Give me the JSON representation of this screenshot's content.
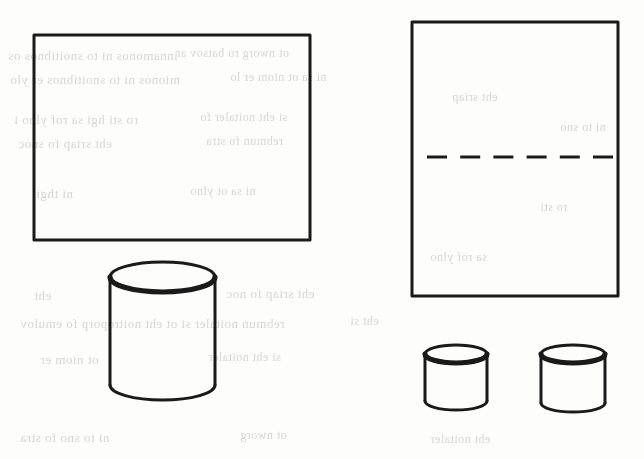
{
  "page": {
    "width": 644,
    "height": 459,
    "background_color": "#fdfdfc",
    "ink_color": "#1a1a1a",
    "bleed_text_color": "#cfcfcf"
  },
  "figure": {
    "caption": "",
    "shapes": [
      {
        "id": "left-rectangle",
        "name": "left-rectangle",
        "type": "rectangle",
        "x": 34,
        "y": 35,
        "width": 276,
        "height": 205,
        "stroke_width": 3,
        "fill": "none"
      },
      {
        "id": "large-cylinder",
        "name": "large-cylinder",
        "type": "cylinder",
        "x": 110,
        "y": 262,
        "width": 105,
        "height": 138,
        "ellipse_ry": 15,
        "stroke_width": 3,
        "fill": "none"
      },
      {
        "id": "right-rectangle",
        "name": "right-rectangle",
        "type": "rectangle",
        "x": 412,
        "y": 22,
        "width": 206,
        "height": 274,
        "stroke_width": 3,
        "fill": "none"
      },
      {
        "id": "divider-dashed-line",
        "name": "divider-dashed-line",
        "type": "dashed-line",
        "x1": 427,
        "y1": 157,
        "x2": 613,
        "y2": 157,
        "stroke_width": 3,
        "dash_count": 6,
        "dash_length": 20,
        "gap_length": 13
      },
      {
        "id": "small-cylinder-left",
        "name": "small-cylinder-left",
        "type": "cylinder",
        "x": 425,
        "y": 345,
        "width": 62,
        "height": 65,
        "ellipse_ry": 9,
        "stroke_width": 3,
        "fill": "none"
      },
      {
        "id": "small-cylinder-right",
        "name": "small-cylinder-right",
        "type": "cylinder",
        "x": 541,
        "y": 345,
        "width": 64,
        "height": 67,
        "ellipse_ry": 9,
        "stroke_width": 3,
        "fill": "none"
      }
    ]
  },
  "bleed_through": {
    "note": "Illegible mirrored show-through text from the opposite side of the scanned page.",
    "lines": [
      {
        "text": "innamonos ni to snoitibnos os",
        "x": 8,
        "y": 48,
        "size": 13
      },
      {
        "text": "ot nworg ro batsov ar",
        "x": 176,
        "y": 46,
        "size": 12
      },
      {
        "text": "mionos ni to snoitibnos er ylo",
        "x": 10,
        "y": 72,
        "size": 13
      },
      {
        "text": "ni sa ot niom er lo",
        "x": 230,
        "y": 70,
        "size": 12
      },
      {
        "text": "ro sti hgi sa rof ylno i",
        "x": 14,
        "y": 112,
        "size": 13
      },
      {
        "text": "si eht noitaler fo ",
        "x": 200,
        "y": 110,
        "size": 12
      },
      {
        "text": "eht sriap fo snoc",
        "x": 18,
        "y": 136,
        "size": 13
      },
      {
        "text": "rebmun fo stra",
        "x": 206,
        "y": 134,
        "size": 12
      },
      {
        "text": "ni thgi",
        "x": 36,
        "y": 186,
        "size": 13
      },
      {
        "text": "ni sa ot ylno",
        "x": 190,
        "y": 184,
        "size": 12
      },
      {
        "text": "eht",
        "x": 34,
        "y": 288,
        "size": 13
      },
      {
        "text": "eht sriap fo noc",
        "x": 226,
        "y": 286,
        "size": 13
      },
      {
        "text": "rebmun noitaler si ot eht noitroporp fo emulov",
        "x": 20,
        "y": 316,
        "size": 13
      },
      {
        "text": "eht si",
        "x": 350,
        "y": 314,
        "size": 12
      },
      {
        "text": "ot niom er",
        "x": 40,
        "y": 352,
        "size": 13
      },
      {
        "text": "si eht noitaler",
        "x": 208,
        "y": 350,
        "size": 12
      },
      {
        "text": "sa rof ylno",
        "x": 430,
        "y": 250,
        "size": 12
      },
      {
        "text": "ni to sno",
        "x": 560,
        "y": 120,
        "size": 12
      },
      {
        "text": "eht sriap",
        "x": 452,
        "y": 90,
        "size": 12
      },
      {
        "text": "ro sti",
        "x": 540,
        "y": 200,
        "size": 12
      },
      {
        "text": "eht noitaler",
        "x": 430,
        "y": 432,
        "size": 12
      },
      {
        "text": "ni to sno fo stra",
        "x": 20,
        "y": 430,
        "size": 13
      },
      {
        "text": "ot nworg",
        "x": 240,
        "y": 428,
        "size": 12
      }
    ]
  }
}
